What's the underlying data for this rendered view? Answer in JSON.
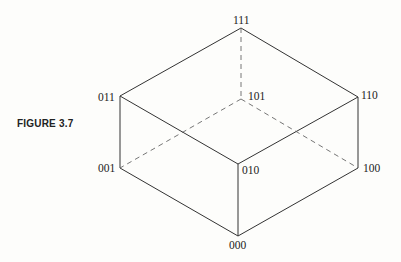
{
  "figure": {
    "label": "FIGURE 3.7",
    "type": "3-cube (binary vertex labels)",
    "vertices": [
      {
        "id": "111",
        "label": "111",
        "x": 241,
        "y": 28
      },
      {
        "id": "011",
        "label": "011",
        "x": 120,
        "y": 96
      },
      {
        "id": "101",
        "label": "101",
        "x": 242,
        "y": 99
      },
      {
        "id": "110",
        "label": "110",
        "x": 358,
        "y": 97
      },
      {
        "id": "001",
        "label": "001",
        "x": 120,
        "y": 168
      },
      {
        "id": "010",
        "label": "010",
        "x": 238,
        "y": 164
      },
      {
        "id": "100",
        "label": "100",
        "x": 358,
        "y": 168
      },
      {
        "id": "000",
        "label": "000",
        "x": 238,
        "y": 236
      }
    ],
    "edges_solid": [
      [
        "111",
        "011"
      ],
      [
        "111",
        "110"
      ],
      [
        "011",
        "010"
      ],
      [
        "110",
        "010"
      ],
      [
        "011",
        "001"
      ],
      [
        "010",
        "000"
      ],
      [
        "110",
        "100"
      ],
      [
        "001",
        "000"
      ],
      [
        "100",
        "000"
      ]
    ],
    "edges_dashed": [
      [
        "111",
        "101"
      ],
      [
        "101",
        "001"
      ],
      [
        "101",
        "100"
      ]
    ]
  }
}
